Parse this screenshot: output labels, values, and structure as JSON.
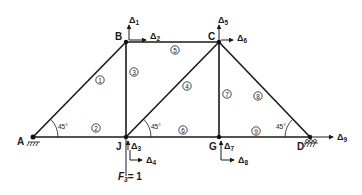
{
  "diagram": {
    "type": "truss",
    "nodes": [
      {
        "id": "A",
        "label": "A",
        "x": 33,
        "y": 137
      },
      {
        "id": "B",
        "label": "B",
        "x": 126,
        "y": 42
      },
      {
        "id": "C",
        "label": "C",
        "x": 219,
        "y": 42
      },
      {
        "id": "J",
        "label": "J",
        "x": 126,
        "y": 137
      },
      {
        "id": "G",
        "label": "G",
        "x": 219,
        "y": 137
      },
      {
        "id": "D",
        "label": "D",
        "x": 310,
        "y": 137
      }
    ],
    "members": [
      {
        "number": "1",
        "from": "A",
        "to": "B"
      },
      {
        "number": "2",
        "from": "A",
        "to": "J"
      },
      {
        "number": "3",
        "from": "B",
        "to": "J"
      },
      {
        "number": "4",
        "from": "J",
        "to": "C"
      },
      {
        "number": "5",
        "from": "B",
        "to": "C"
      },
      {
        "number": "6",
        "from": "J",
        "to": "G"
      },
      {
        "number": "7",
        "from": "C",
        "to": "G"
      },
      {
        "number": "8",
        "from": "C",
        "to": "D"
      },
      {
        "number": "9",
        "from": "G",
        "to": "D"
      }
    ],
    "degrees_of_freedom": [
      {
        "label": "Δ",
        "sub": "1",
        "node": "B",
        "direction": "vertical"
      },
      {
        "label": "Δ",
        "sub": "2",
        "node": "B",
        "direction": "horizontal"
      },
      {
        "label": "Δ",
        "sub": "3",
        "node": "J",
        "direction": "vertical"
      },
      {
        "label": "Δ",
        "sub": "4",
        "node": "J",
        "direction": "horizontal"
      },
      {
        "label": "Δ",
        "sub": "5",
        "node": "C",
        "direction": "vertical"
      },
      {
        "label": "Δ",
        "sub": "6",
        "node": "C",
        "direction": "horizontal"
      },
      {
        "label": "Δ",
        "sub": "7",
        "node": "G",
        "direction": "vertical"
      },
      {
        "label": "Δ",
        "sub": "8",
        "node": "G",
        "direction": "horizontal"
      },
      {
        "label": "Δ",
        "sub": "9",
        "node": "D",
        "direction": "horizontal"
      }
    ],
    "angles": [
      {
        "label": "45°",
        "at": "A"
      },
      {
        "label": "45°",
        "at": "J"
      },
      {
        "label": "45°",
        "at": "D"
      }
    ],
    "supports": [
      {
        "node": "A",
        "type": "pin"
      },
      {
        "node": "D",
        "type": "roller"
      }
    ],
    "load": {
      "node": "J",
      "label_main": "F",
      "label_sub": "3",
      "label_eq": "= 1"
    }
  }
}
